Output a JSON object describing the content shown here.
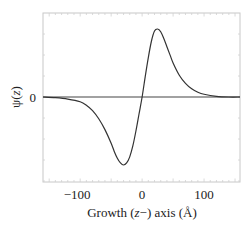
{
  "chart_data": {
    "type": "line",
    "title": "",
    "xlabel": "Growth (z−) axis (Å)",
    "ylabel": "ψ(z)",
    "xlim": [
      -160,
      158
    ],
    "ylim": [
      -1.0,
      1.0
    ],
    "x_ticks": [
      -100,
      0,
      100
    ],
    "x_tick_labels": [
      "−100",
      "0",
      "100"
    ],
    "y_ticks": [
      0
    ],
    "y_tick_labels": [
      "0"
    ],
    "grid": false,
    "legend": null,
    "zero_line": true,
    "series": [
      {
        "name": "ψ(z)",
        "color": "#333333",
        "x": [
          -160,
          -140,
          -120,
          -100,
          -90,
          -80,
          -70,
          -60,
          -50,
          -45,
          -40,
          -35,
          -30,
          -25,
          -20,
          -15,
          -10,
          -5,
          0,
          5,
          10,
          15,
          20,
          25,
          30,
          35,
          40,
          45,
          50,
          60,
          70,
          80,
          90,
          100,
          120,
          140,
          158
        ],
        "y": [
          -0.0,
          -0.01,
          -0.03,
          -0.07,
          -0.12,
          -0.2,
          -0.32,
          -0.48,
          -0.68,
          -0.8,
          -0.9,
          -0.97,
          -1.0,
          -0.97,
          -0.88,
          -0.72,
          -0.5,
          -0.25,
          0.0,
          0.3,
          0.58,
          0.82,
          0.97,
          1.0,
          0.96,
          0.86,
          0.74,
          0.62,
          0.5,
          0.32,
          0.2,
          0.12,
          0.07,
          0.04,
          0.01,
          0.0,
          0.0
        ]
      }
    ]
  },
  "labels": {
    "xlabel_prefix": "Growth (",
    "xlabel_z": "z",
    "xlabel_suffix": "−) axis (Å)",
    "ylabel_psi": "ψ(",
    "ylabel_z": "z",
    "ylabel_close": ")"
  }
}
